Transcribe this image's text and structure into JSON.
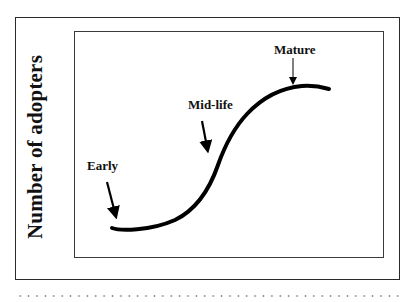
{
  "diagram": {
    "type": "s-curve adoption lifecycle",
    "y_axis_label": "Number of adopters",
    "x_axis_label": "",
    "annotations": [
      {
        "id": "early",
        "label": "Early"
      },
      {
        "id": "mid_life",
        "label": "Mid-life"
      },
      {
        "id": "mature",
        "label": "Mature"
      }
    ],
    "colors": {
      "curve": "#000000",
      "frame": "#2a2a2a",
      "text": "#111111",
      "background": "#ffffff",
      "dotted_rule": "#8a8a8a"
    }
  }
}
